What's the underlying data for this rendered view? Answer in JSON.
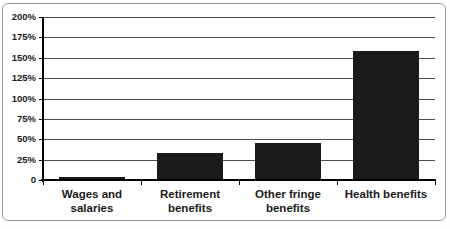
{
  "chart_data": {
    "type": "bar",
    "categories": [
      "Wages and\nsalaries",
      "Retirement\nbenefits",
      "Other fringe\nbenefits",
      "Health benefits"
    ],
    "values": [
      4,
      33,
      46,
      158
    ],
    "title": "",
    "xlabel": "",
    "ylabel": "",
    "ylim": [
      0,
      200
    ],
    "ytick_step": 25,
    "ytick_labels": [
      "0",
      "25%",
      "50%",
      "75%",
      "100%",
      "125%",
      "150%",
      "175%",
      "200%"
    ],
    "grid": true,
    "legend": false,
    "colors": {
      "bar": "#1a1a1a",
      "gridline": "#4d4d4d",
      "axis": "#000000",
      "text": "#1a1a1a",
      "frame_border": "#9a9a9a",
      "background": "#ffffff"
    }
  }
}
